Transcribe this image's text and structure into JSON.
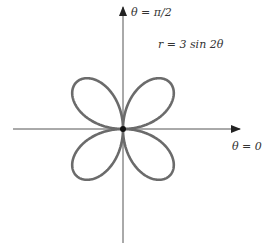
{
  "chart_data": {
    "type": "line",
    "subtype": "polar-rose",
    "title": "",
    "equation": "r = 3 sin 2θ",
    "amplitude": 3,
    "frequency": 2,
    "petals": 4,
    "axis_labels": {
      "polar_axis": "θ = 0",
      "vertical_axis": "θ = π/2"
    },
    "grid": false,
    "legend": null,
    "colors": {
      "curve": "#6b6b6b",
      "axis": "#444444"
    }
  },
  "labels": {
    "equation": "r = 3 sin 2θ",
    "theta_zero": "θ = 0",
    "theta_half_pi": "θ = π/2"
  }
}
